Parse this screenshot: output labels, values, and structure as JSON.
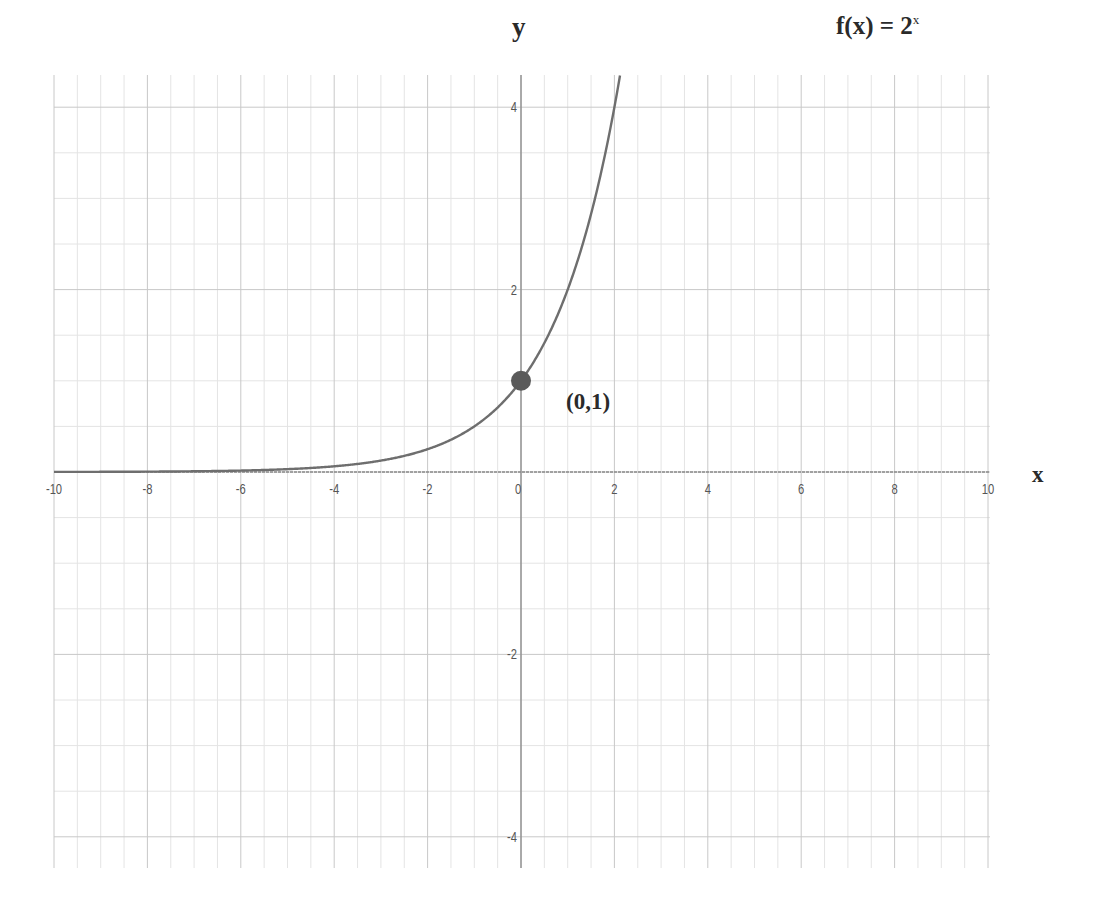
{
  "chart_data": {
    "type": "line",
    "title_base": "f(x) = 2",
    "title_exponent": "x",
    "function": "2^x",
    "xlabel": "x",
    "ylabel": "y",
    "xlim": [
      -10,
      10
    ],
    "ylim": [
      -4.3,
      4.3
    ],
    "x_ticks": [
      -10,
      -8,
      -6,
      -4,
      -2,
      0,
      2,
      4,
      6,
      8,
      10
    ],
    "y_ticks": [
      -4,
      -2,
      2,
      4
    ],
    "grid": true,
    "minor_grid_step": 0.5,
    "legend": "none",
    "series": [
      {
        "name": "f(x) = 2^x",
        "x": [
          -10,
          -8,
          -6,
          -4,
          -3,
          -2,
          -1,
          0,
          0.5,
          1,
          1.5,
          2,
          2.1
        ],
        "y": [
          0.001,
          0.004,
          0.016,
          0.0625,
          0.125,
          0.25,
          0.5,
          1,
          1.414,
          2,
          2.828,
          4,
          4.29
        ],
        "color": "#6e6e6e"
      }
    ],
    "annotations": [
      {
        "type": "point",
        "x": 0,
        "y": 1,
        "label": "(0,1)",
        "color": "#5a5a5a"
      }
    ]
  },
  "labels": {
    "title_base": "f(x) = 2",
    "title_exponent": "x",
    "x_axis": "x",
    "y_axis": "y",
    "point": "(0,1)"
  },
  "colors": {
    "background": "#ffffff",
    "major_grid": "#c8c8c8",
    "minor_grid": "#e4e4e4",
    "axis": "#8a8a8a",
    "curve": "#6e6e6e",
    "point": "#5a5a5a",
    "tick_text": "#555555"
  }
}
